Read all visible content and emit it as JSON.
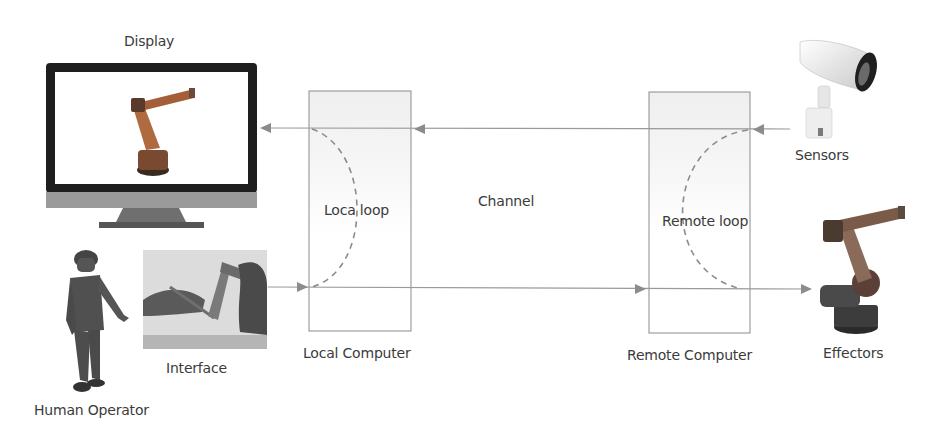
{
  "labels": {
    "display": "Display",
    "interface": "Interface",
    "human_operator": "Human Operator",
    "local_computer": "Local Computer",
    "local_loop": "Loca loop",
    "channel": "Channel",
    "remote_loop": "Remote loop",
    "remote_computer": "Remote Computer",
    "sensors": "Sensors",
    "effectors": "Effectors"
  },
  "icons": {
    "display": "monitor-with-robot-arm-icon",
    "interface": "haptic-interface-photo-icon",
    "human_operator": "human-figure-icon",
    "sensors": "security-camera-icon",
    "effectors": "industrial-robot-arm-icon"
  },
  "flows": [
    {
      "from": "sensors",
      "to": "remote_computer",
      "direction": "left"
    },
    {
      "from": "remote_computer",
      "to": "local_computer",
      "direction": "left"
    },
    {
      "from": "local_computer",
      "to": "display",
      "direction": "left"
    },
    {
      "from": "interface",
      "to": "local_computer",
      "direction": "right"
    },
    {
      "from": "local_computer",
      "to": "remote_computer",
      "direction": "right"
    },
    {
      "from": "remote_computer",
      "to": "effectors",
      "direction": "right"
    }
  ],
  "colors": {
    "line": "#8c8c8c",
    "box_border": "#8c8c8c",
    "box_fill_top": "#f1f1f1",
    "monitor_frame": "#1e1e1e",
    "monitor_chin": "#9a9a9a",
    "robot_orange": "#b86a3c"
  }
}
